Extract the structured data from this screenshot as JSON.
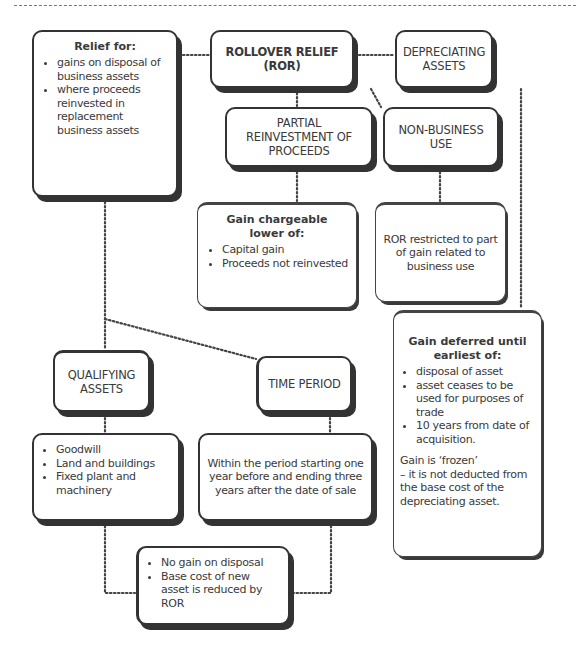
{
  "diagram": {
    "title": "ROLLOVER RELIEF (ROR)",
    "relief_box": {
      "heading": "Relief for:",
      "items": [
        "gains on disposal of business assets",
        "where proceeds reinvested in replacement business assets"
      ]
    },
    "depreciating_assets": {
      "label": "DEPRECIATING ASSETS"
    },
    "partial_reinvestment": {
      "label": "PARTIAL REINVESTMENT OF PROCEEDS"
    },
    "non_business_use": {
      "label": "NON-BUSINESS USE"
    },
    "gain_chargeable": {
      "heading": "Gain chargeable lower of:",
      "items": [
        "Capital gain",
        "Proceeds not reinvested"
      ]
    },
    "ror_restricted": {
      "text": "ROR restricted to part of gain related to business use"
    },
    "gain_deferred": {
      "heading": "Gain deferred until earliest of:",
      "items": [
        "disposal of asset",
        "asset ceases to be used for purposes of trade",
        "10 years from date of acquisition."
      ],
      "note_line1": "Gain is ‘frozen’",
      "note_line2": "– it is not deducted from the base cost of the depreciating asset."
    },
    "qualifying_assets": {
      "label": "QUALIFYING ASSETS",
      "items": [
        "Goodwill",
        "Land and buildings",
        "Fixed plant and machinery"
      ]
    },
    "time_period": {
      "label": "TIME PERIOD",
      "text": "Within the period starting one year before and ending three years after the date of sale"
    },
    "result": {
      "items": [
        "No gain on disposal",
        "Base cost of new asset is reduced by ROR"
      ]
    }
  }
}
